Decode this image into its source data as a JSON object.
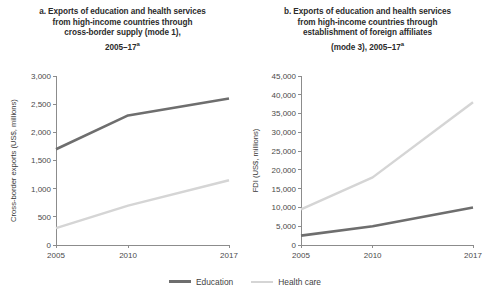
{
  "figure": {
    "width": 490,
    "height": 297,
    "background": "#ffffff"
  },
  "legend": {
    "position": "bottom-center",
    "items": [
      {
        "label": "Education",
        "color": "#6e6e6e"
      },
      {
        "label": "Health care",
        "color": "#d5d5d5"
      }
    ]
  },
  "panels": [
    {
      "id": "panel-a",
      "title_lines": [
        "a. Exports of education and health services",
        "from high-income countries through",
        "cross-border supply (mode 1),",
        "2005–17"
      ],
      "title_superscript": "a"
    },
    {
      "id": "panel-b",
      "title_lines": [
        "b. Exports of education and health services",
        "from high-income countries through",
        "establishment of foreign affiliates",
        "(mode 3), 2005–17"
      ],
      "title_superscript": "a"
    }
  ],
  "chart_data": [
    {
      "type": "line",
      "id": "panel-a",
      "title": "a. Exports of education and health services from high-income countries through cross-border supply (mode 1), 2005–17a",
      "xlabel": "",
      "ylabel": "Cross-border exports (US$, millions)",
      "x": [
        2005,
        2010,
        2017
      ],
      "xticklabels": [
        "2005",
        "2010",
        "2017"
      ],
      "xlim": [
        2005,
        2017
      ],
      "ylim": [
        0,
        3000
      ],
      "yticks": [
        0,
        500,
        1000,
        1500,
        2000,
        2500,
        3000
      ],
      "yticklabels": [
        "0",
        "500",
        "1,000",
        "1,500",
        "2,000",
        "2,500",
        "3,000"
      ],
      "grid": false,
      "series": [
        {
          "name": "Education",
          "color": "#6e6e6e",
          "width": 2.6,
          "values": [
            1700,
            2300,
            2600
          ]
        },
        {
          "name": "Health care",
          "color": "#d5d5d5",
          "width": 2.4,
          "values": [
            300,
            700,
            1150
          ]
        }
      ]
    },
    {
      "type": "line",
      "id": "panel-b",
      "title": "b. Exports of education and health services from high-income countries through establishment of foreign affiliates (mode 3), 2005–17a",
      "xlabel": "",
      "ylabel": "FDI (US$, millions)",
      "x": [
        2005,
        2010,
        2017
      ],
      "xticklabels": [
        "2005",
        "2010",
        "2017"
      ],
      "xlim": [
        2005,
        2017
      ],
      "ylim": [
        0,
        45000
      ],
      "yticks": [
        0,
        5000,
        10000,
        15000,
        20000,
        25000,
        30000,
        35000,
        40000,
        45000
      ],
      "yticklabels": [
        "0",
        "5,000",
        "10,000",
        "15,000",
        "20,000",
        "25,000",
        "30,000",
        "35,000",
        "40,000",
        "45,000"
      ],
      "grid": false,
      "series": [
        {
          "name": "Education",
          "color": "#6e6e6e",
          "width": 2.6,
          "values": [
            2500,
            5000,
            10000
          ]
        },
        {
          "name": "Health care",
          "color": "#d5d5d5",
          "width": 2.4,
          "values": [
            9500,
            18000,
            38000
          ]
        }
      ]
    }
  ]
}
